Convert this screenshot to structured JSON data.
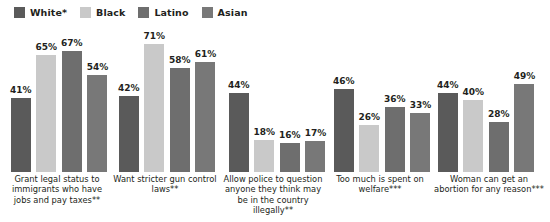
{
  "chart_data": {
    "type": "bar",
    "title": "",
    "subtitle": "",
    "xlabel": "",
    "ylabel": "",
    "ylim": [
      0,
      75
    ],
    "grid": false,
    "legend_position": "top-left",
    "value_label_suffix": "%",
    "categories": [
      "Grant legal status to immigrants who have jobs and pay taxes**",
      "Want stricter gun control laws**",
      "Allow police to question anyone they think may be in the country illegally**",
      "Too much is spent on welfare***",
      "Woman can get an abortion for any reason***"
    ],
    "series": [
      {
        "name": "White*",
        "color": "#5a5a5a",
        "values": [
          41,
          42,
          44,
          46,
          44
        ]
      },
      {
        "name": "Black",
        "color": "#c9c9c9",
        "values": [
          65,
          71,
          18,
          26,
          40
        ]
      },
      {
        "name": "Latino",
        "color": "#6e6e6e",
        "values": [
          67,
          58,
          16,
          36,
          28
        ]
      },
      {
        "name": "Asian",
        "color": "#787878",
        "values": [
          54,
          61,
          17,
          33,
          49
        ]
      }
    ]
  },
  "legend": {
    "items": [
      {
        "label": "White*",
        "color": "#5a5a5a"
      },
      {
        "label": "Black",
        "color": "#c9c9c9"
      },
      {
        "label": "Latino",
        "color": "#6e6e6e"
      },
      {
        "label": "Asian",
        "color": "#787878"
      }
    ]
  },
  "groups": [
    {
      "caption": "Grant legal status to immigrants who have jobs and pay taxes**",
      "bars": [
        {
          "series": "White*",
          "value": 41,
          "label": "41%",
          "color": "#5a5a5a"
        },
        {
          "series": "Black",
          "value": 65,
          "label": "65%",
          "color": "#c9c9c9"
        },
        {
          "series": "Latino",
          "value": 67,
          "label": "67%",
          "color": "#6e6e6e"
        },
        {
          "series": "Asian",
          "value": 54,
          "label": "54%",
          "color": "#787878"
        }
      ]
    },
    {
      "caption": "Want stricter gun control laws**",
      "bars": [
        {
          "series": "White*",
          "value": 42,
          "label": "42%",
          "color": "#5a5a5a"
        },
        {
          "series": "Black",
          "value": 71,
          "label": "71%",
          "color": "#c9c9c9"
        },
        {
          "series": "Latino",
          "value": 58,
          "label": "58%",
          "color": "#6e6e6e"
        },
        {
          "series": "Asian",
          "value": 61,
          "label": "61%",
          "color": "#787878"
        }
      ]
    },
    {
      "caption": "Allow police to question anyone they think may be in the country illegally**",
      "bars": [
        {
          "series": "White*",
          "value": 44,
          "label": "44%",
          "color": "#5a5a5a"
        },
        {
          "series": "Black",
          "value": 18,
          "label": "18%",
          "color": "#c9c9c9"
        },
        {
          "series": "Latino",
          "value": 16,
          "label": "16%",
          "color": "#6e6e6e"
        },
        {
          "series": "Asian",
          "value": 17,
          "label": "17%",
          "color": "#787878"
        }
      ]
    },
    {
      "caption": "Too much is spent on welfare***",
      "bars": [
        {
          "series": "White*",
          "value": 46,
          "label": "46%",
          "color": "#5a5a5a"
        },
        {
          "series": "Black",
          "value": 26,
          "label": "26%",
          "color": "#c9c9c9"
        },
        {
          "series": "Latino",
          "value": 36,
          "label": "36%",
          "color": "#6e6e6e"
        },
        {
          "series": "Asian",
          "value": 33,
          "label": "33%",
          "color": "#787878"
        }
      ]
    },
    {
      "caption": "Woman can get an abortion for any reason***",
      "bars": [
        {
          "series": "White*",
          "value": 44,
          "label": "44%",
          "color": "#5a5a5a"
        },
        {
          "series": "Black",
          "value": 40,
          "label": "40%",
          "color": "#c9c9c9"
        },
        {
          "series": "Latino",
          "value": 28,
          "label": "28%",
          "color": "#6e6e6e"
        },
        {
          "series": "Asian",
          "value": 49,
          "label": "49%",
          "color": "#787878"
        }
      ]
    }
  ]
}
